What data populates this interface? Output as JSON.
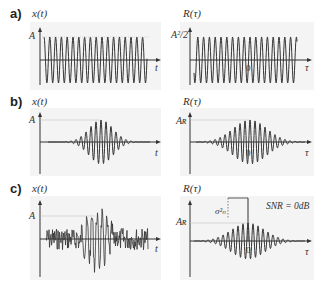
{
  "rows": [
    {
      "label": "a)",
      "left": {
        "func": "x(t)",
        "level": "A",
        "axis": "t",
        "kind": "sine"
      },
      "right": {
        "func": "R(τ)",
        "level": "A²/2",
        "axis": "τ",
        "zero": "0",
        "kind": "sine"
      }
    },
    {
      "label": "b)",
      "left": {
        "func": "x(t)",
        "level": "A",
        "axis": "t",
        "kind": "burst"
      },
      "right": {
        "func": "R(τ)",
        "level": "Aʀ",
        "axis": "τ",
        "zero": "0",
        "kind": "burst-acf"
      }
    },
    {
      "label": "c)",
      "left": {
        "func": "x(t)",
        "level": "A",
        "axis": "t",
        "kind": "noisy-burst"
      },
      "right": {
        "func": "R(τ)",
        "level": "Aʀ",
        "axis": "τ",
        "zero": "0",
        "kind": "burst-acf-noise",
        "sigma": "σ²ₙ",
        "snr": "SNR = 0dB"
      }
    }
  ],
  "colors": {
    "line": "#333333",
    "guide": "#bbbbbb",
    "panel": "#f4f4f4"
  }
}
